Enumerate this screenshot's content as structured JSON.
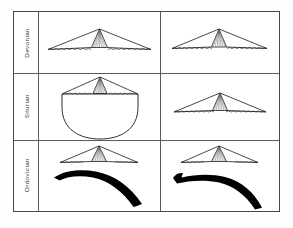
{
  "figure": {
    "background_color": "#ffffff",
    "frame_color": "#4a4a4a",
    "rule_color": "#5a5a5a",
    "ink_color": "#1a1a1a",
    "fill_black": "#000000"
  },
  "rows": [
    {
      "id": "devonian",
      "label": "Devonian"
    },
    {
      "id": "silurian",
      "label": "Silurian"
    },
    {
      "id": "ordovician",
      "label": "Ordovician"
    }
  ],
  "columns": [
    {
      "id": "col-left",
      "label": ""
    },
    {
      "id": "col-right",
      "label": ""
    }
  ],
  "cells": [
    {
      "row": "devonian",
      "column": "col-left",
      "specimens": [
        "wide-tent-shell-with-hatched-umbo"
      ],
      "description": "Wide low tent-shaped shell outline with central hatched triangular umbo and crenulated commissure line"
    },
    {
      "row": "devonian",
      "column": "col-right",
      "specimens": [
        "wide-tent-shell-with-hatched-umbo"
      ],
      "description": "Wide low tent-shaped shell outline with central hatched triangular umbo and crenulated commissure line"
    },
    {
      "row": "silurian",
      "column": "col-left",
      "specimens": [
        "tent-shell-with-hatched-umbo",
        "large-rounded-fan-outline"
      ],
      "description": "Tent-shaped shell above a large rounded bowl/fan-shaped outline"
    },
    {
      "row": "silurian",
      "column": "col-right",
      "specimens": [
        "wide-tent-shell-with-hatched-umbo"
      ],
      "description": "Wide low tent-shaped shell outline with central hatched triangular umbo"
    },
    {
      "row": "ordovician",
      "column": "col-left",
      "specimens": [
        "tent-shell-with-hatched-umbo",
        "black-arched-crescent"
      ],
      "description": "Tent-shaped shell above a solid black strongly arched tapering crescent"
    },
    {
      "row": "ordovician",
      "column": "col-right",
      "specimens": [
        "tent-shell-with-hatched-umbo",
        "black-flat-crescent-notched"
      ],
      "description": "Tent-shaped shell above a solid black flatter elongate crescent with a notched left tip"
    }
  ]
}
